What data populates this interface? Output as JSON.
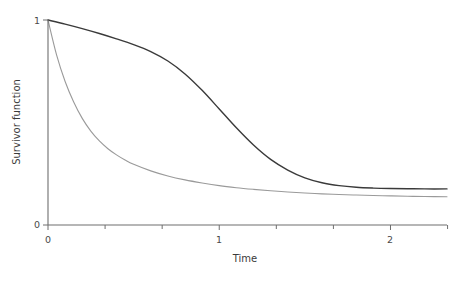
{
  "chart_data": {
    "type": "line",
    "title": "",
    "subtitle": "",
    "xlabel": "Time",
    "ylabel": "Survivor function",
    "xlim": [
      0,
      2.33
    ],
    "ylim": [
      0,
      1.05
    ],
    "grid": false,
    "legend": "none",
    "x_ticks": [
      {
        "value": 0,
        "label": "0",
        "major": true
      },
      {
        "value": 0.3333,
        "label": "",
        "major": false
      },
      {
        "value": 0.6667,
        "label": "",
        "major": false
      },
      {
        "value": 1,
        "label": "1",
        "major": true
      },
      {
        "value": 1.3333,
        "label": "",
        "major": false
      },
      {
        "value": 1.6667,
        "label": "",
        "major": false
      },
      {
        "value": 2,
        "label": "2",
        "major": true
      },
      {
        "value": 2.3333,
        "label": "",
        "major": false
      }
    ],
    "y_ticks": [
      {
        "value": 0,
        "label": "0",
        "major": true
      },
      {
        "value": 1,
        "label": "1",
        "major": true
      }
    ],
    "series": [
      {
        "name": "dark-curve",
        "color": "#3a3a3a",
        "width": 1.4,
        "style": "solid",
        "x": [
          0.0,
          0.1,
          0.2,
          0.3,
          0.4,
          0.5,
          0.6,
          0.7,
          0.8,
          0.9,
          1.0,
          1.1,
          1.2,
          1.3,
          1.4,
          1.5,
          1.6,
          1.7,
          1.8,
          1.9,
          2.0,
          2.1,
          2.2,
          2.33
        ],
        "y": [
          1.0,
          0.98,
          0.958,
          0.934,
          0.908,
          0.88,
          0.846,
          0.8,
          0.737,
          0.657,
          0.566,
          0.474,
          0.39,
          0.32,
          0.268,
          0.23,
          0.206,
          0.192,
          0.184,
          0.18,
          0.178,
          0.177,
          0.176,
          0.176
        ]
      },
      {
        "name": "light-curve",
        "color": "#9a9a9a",
        "width": 1.1,
        "style": "solid",
        "x": [
          0.0,
          0.05,
          0.1,
          0.15,
          0.2,
          0.25,
          0.3,
          0.35,
          0.4,
          0.45,
          0.5,
          0.6,
          0.7,
          0.8,
          0.9,
          1.0,
          1.1,
          1.2,
          1.3,
          1.4,
          1.5,
          1.6,
          1.7,
          1.8,
          1.9,
          2.0,
          2.1,
          2.2,
          2.33
        ],
        "y": [
          1.0,
          0.83,
          0.7,
          0.6,
          0.52,
          0.458,
          0.41,
          0.372,
          0.342,
          0.317,
          0.296,
          0.264,
          0.239,
          0.22,
          0.205,
          0.192,
          0.182,
          0.174,
          0.167,
          0.161,
          0.156,
          0.152,
          0.149,
          0.146,
          0.144,
          0.142,
          0.14,
          0.139,
          0.138
        ]
      }
    ]
  },
  "axes": {
    "x_title": "Time",
    "y_title": "Survivor function",
    "x_tick_0": "0",
    "x_tick_1": "1",
    "x_tick_2": "2",
    "y_tick_0": "0",
    "y_tick_1": "1"
  },
  "colors": {
    "axis": "#6e6e6e",
    "dark_series": "#3a3a3a",
    "light_series": "#9a9a9a",
    "background": "#ffffff",
    "text": "#3b3b3b"
  }
}
